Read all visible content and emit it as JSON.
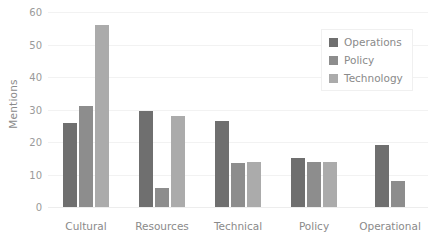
{
  "chart_data": {
    "type": "bar",
    "title": "",
    "xlabel": "",
    "ylabel": "Mentions",
    "ylim": [
      0,
      60
    ],
    "yticks": [
      0,
      10,
      20,
      30,
      40,
      50,
      60
    ],
    "grid": true,
    "legend_position": "top-right",
    "categories": [
      "Cultural",
      "Resources",
      "Technical",
      "Policy",
      "Operational"
    ],
    "series": [
      {
        "name": "Operations",
        "color": "#6f6f6f",
        "values": [
          26,
          29.5,
          26.5,
          15,
          19
        ]
      },
      {
        "name": "Policy",
        "color": "#8d8d8d",
        "values": [
          31,
          6,
          13.5,
          14,
          8
        ]
      },
      {
        "name": "Technology",
        "color": "#ababab",
        "values": [
          56,
          28,
          14,
          14,
          null
        ]
      }
    ]
  }
}
